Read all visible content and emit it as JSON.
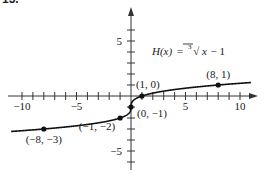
{
  "problem_number": "15.",
  "chart_data": {
    "type": "line",
    "title": "",
    "function_label": {
      "name": "H(x)",
      "equals": "=",
      "root_index": "3",
      "radicand": "x",
      "tail": "− 1"
    },
    "xlabel": "",
    "ylabel": "",
    "xlim": [
      -11,
      11
    ],
    "ylim": [
      -7,
      7
    ],
    "x_tick_labels": [
      "−10",
      "−5",
      "5",
      "10"
    ],
    "x_tick_values": [
      -10,
      -5,
      5,
      10
    ],
    "y_tick_labels": [
      "5",
      "−5"
    ],
    "y_tick_values": [
      5,
      -5
    ],
    "grid": false,
    "series": [
      {
        "name": "H(x) = cbrt(x) - 1",
        "x_range": [
          -11,
          11
        ],
        "formula": "cbrt(x) - 1"
      }
    ],
    "points": [
      {
        "x": -8,
        "y": -3,
        "label": "(−8, −3)"
      },
      {
        "x": -1,
        "y": -2,
        "label": "(−1, −2)"
      },
      {
        "x": 0,
        "y": -1,
        "label": "(0, −1)"
      },
      {
        "x": 1,
        "y": 0,
        "label": "(1, 0)"
      },
      {
        "x": 8,
        "y": 1,
        "label": "(8, 1)"
      }
    ],
    "colors": {
      "axis": "#333333",
      "curve": "#111111",
      "point": "#111111"
    }
  }
}
